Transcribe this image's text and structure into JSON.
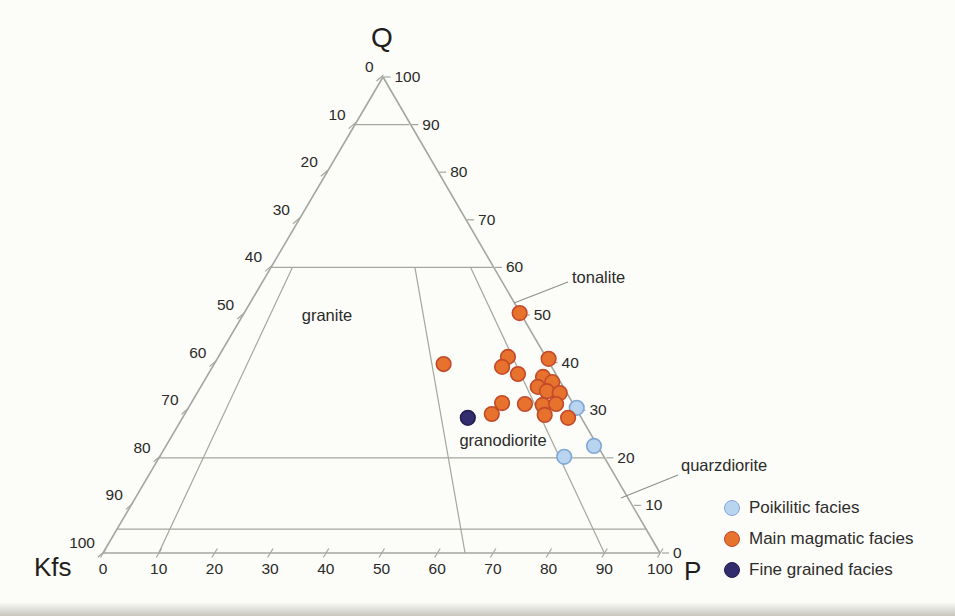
{
  "chart_data": {
    "type": "scatter",
    "variant": "ternary-QAP",
    "axes": {
      "top": "Q",
      "left_corner": "Kfs",
      "right_corner": "P",
      "left_tick_labels": [
        0,
        10,
        20,
        30,
        40,
        50,
        60,
        70,
        80,
        90,
        100
      ],
      "right_tick_labels": [
        100,
        90,
        80,
        70,
        60,
        50,
        40,
        30,
        20,
        10,
        0
      ],
      "bottom_tick_labels": [
        0,
        10,
        20,
        30,
        40,
        50,
        60,
        70,
        80,
        90,
        100
      ]
    },
    "horizontal_gridlines_at_Q": [
      90,
      60,
      20,
      5
    ],
    "field_divider_lines_at_P_ratio": [
      10,
      65,
      90
    ],
    "field_labels": [
      {
        "text": "granite"
      },
      {
        "text": "tonalite"
      },
      {
        "text": "granodiorite"
      },
      {
        "text": "quarzdiorite"
      }
    ],
    "line_color": "#a3a79f",
    "series": [
      {
        "name": "Poikilitic facies",
        "fill": "#b9d4ee",
        "stroke": "#7fa8d6",
        "points": [
          {
            "q": 30.5,
            "p": 69.8
          },
          {
            "q": 22.5,
            "p": 76.9
          },
          {
            "q": 20.2,
            "p": 72.7
          }
        ]
      },
      {
        "name": "Main magmatic facies",
        "fill": "#e6722d",
        "stroke": "#c2492a",
        "points": [
          {
            "q": 50.4,
            "p": 49.6
          },
          {
            "q": 39.7,
            "p": 41.3
          },
          {
            "q": 41.2,
            "p": 52.1
          },
          {
            "q": 39.1,
            "p": 52.1
          },
          {
            "q": 37.6,
            "p": 55.7
          },
          {
            "q": 40.8,
            "p": 59.6
          },
          {
            "q": 37.0,
            "p": 60.5
          },
          {
            "q": 35.9,
            "p": 62.7
          },
          {
            "q": 34.9,
            "p": 60.6
          },
          {
            "q": 34.0,
            "p": 62.7
          },
          {
            "q": 33.6,
            "p": 65.2
          },
          {
            "q": 31.5,
            "p": 55.9
          },
          {
            "q": 31.3,
            "p": 60.1
          },
          {
            "q": 31.1,
            "p": 63.4
          },
          {
            "q": 31.3,
            "p": 65.7
          },
          {
            "q": 29.2,
            "p": 55.2
          },
          {
            "q": 29.0,
            "p": 64.8
          },
          {
            "q": 28.4,
            "p": 69.3
          }
        ]
      },
      {
        "name": "Fine grained facies",
        "fill": "#332d6e",
        "stroke": "#221d52",
        "points": [
          {
            "q": 28.4,
            "p": 51.3
          }
        ]
      }
    ]
  }
}
